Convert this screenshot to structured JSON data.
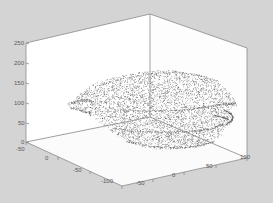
{
  "figure": {
    "background_color": "#d4d4d4",
    "axes_background_color": "#ffffff",
    "axis_line_color": "#8a8a8a",
    "tick_label_color": "#5a5a5a",
    "point_color": "#2b2b2b"
  },
  "chart_data": {
    "type": "scatter",
    "projection": "3d",
    "title": "",
    "xlabel": "",
    "ylabel": "",
    "zlabel": "",
    "grid": false,
    "legend": null,
    "axes": {
      "x": {
        "name": "x-axis",
        "position": "bottom-right",
        "ticks": [
          -100,
          -50,
          0,
          50,
          100
        ],
        "tick_labels": [
          "-100",
          "-50",
          "0",
          "50",
          "100"
        ],
        "lim": [
          -100,
          100
        ]
      },
      "y": {
        "name": "y-axis",
        "position": "bottom-left",
        "ticks": [
          -50,
          0,
          -50,
          -100
        ],
        "tick_labels": [
          "-50",
          "0",
          "-50",
          "-100"
        ],
        "lim": [
          -100,
          50
        ]
      },
      "z": {
        "name": "z-axis",
        "position": "left",
        "ticks": [
          0,
          50,
          100,
          150,
          200,
          250
        ],
        "tick_labels": [
          "0",
          "50",
          "100",
          "150",
          "200",
          "250"
        ],
        "lim": [
          -50,
          250
        ]
      }
    },
    "z_tick_labels": [
      "250",
      "200",
      "150",
      "100",
      "50",
      "0"
    ],
    "z_tick_values": [
      250,
      200,
      150,
      100,
      50,
      0
    ],
    "y_tick_labels": [
      "-50",
      "0",
      "-50",
      "-100"
    ],
    "y_tick_values": [
      -50,
      0,
      -50,
      -100
    ],
    "x_tick_labels": [
      "-50",
      "0",
      "50",
      "100"
    ],
    "x_tick_values": [
      -50,
      0,
      50,
      100
    ],
    "marker": {
      "style": "dot",
      "size": 1,
      "color": "#2b2b2b"
    },
    "point_count_approx": 4200,
    "cloud_extent_px": {
      "x0": 68,
      "y0": 68,
      "x1": 238,
      "y1": 150
    }
  },
  "ticks": {
    "z": [
      {
        "label": "250",
        "x": 14,
        "y": 40
      },
      {
        "label": "200",
        "x": 14,
        "y": 60
      },
      {
        "label": "150",
        "x": 14,
        "y": 80
      },
      {
        "label": "100",
        "x": 14,
        "y": 100
      },
      {
        "label": "50",
        "x": 18,
        "y": 120
      },
      {
        "label": "0",
        "x": 21,
        "y": 139
      }
    ],
    "y": [
      {
        "label": "-50",
        "x": 16,
        "y": 146
      },
      {
        "label": "0",
        "x": 45,
        "y": 155
      },
      {
        "label": "-50",
        "x": 73,
        "y": 167
      },
      {
        "label": "-100",
        "x": 101,
        "y": 178
      }
    ],
    "x": [
      {
        "label": "-50",
        "x": 136,
        "y": 180
      },
      {
        "label": "0",
        "x": 172,
        "y": 172
      },
      {
        "label": "50",
        "x": 206,
        "y": 163
      },
      {
        "label": "100",
        "x": 240,
        "y": 154
      }
    ]
  }
}
